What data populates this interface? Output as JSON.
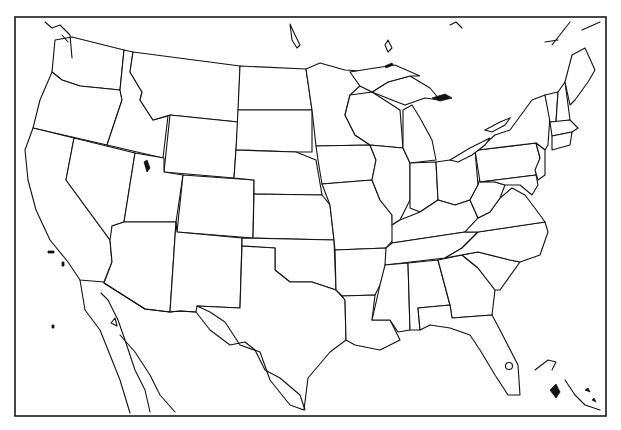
{
  "map": {
    "type": "outline-map",
    "region": "Contiguous United States",
    "labels": [],
    "frame": {
      "x": 15,
      "y": 17,
      "width": 591,
      "height": 399
    },
    "stroke_color": "#111111",
    "background_color": "#ffffff",
    "features": [
      "state-boundaries",
      "great-lakes",
      "mexico-border",
      "baja-california",
      "bahamas",
      "cuba-coast"
    ]
  }
}
